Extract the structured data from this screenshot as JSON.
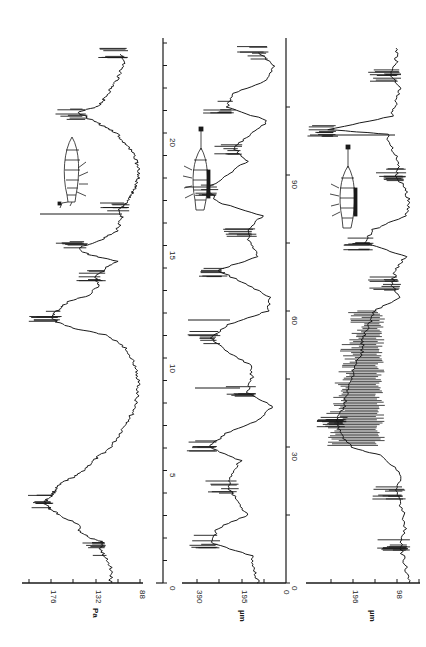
{
  "figure": {
    "orientation": "rotated-90-ccw",
    "ink_color": "#1a1a1a",
    "background": "#ffffff"
  },
  "chart_data": [
    {
      "type": "line",
      "panel": "top",
      "title": "",
      "xlabel": "",
      "ylabel": "Pa",
      "x_ticks": [
        0,
        5,
        10,
        15,
        20
      ],
      "y_ticks": [
        88,
        132,
        176
      ],
      "xlim": [
        0,
        24
      ],
      "ylim": [
        70,
        210
      ],
      "insect_icon": "insect-pressure-sensor",
      "x": [
        0,
        0.5,
        1,
        1.5,
        1.8,
        2,
        2.3,
        2.6,
        3,
        3.3,
        3.6,
        3.9,
        4.2,
        4.5,
        4.8,
        5.2,
        5.6,
        6,
        6.5,
        7,
        7.5,
        8,
        8.5,
        9,
        9.5,
        10,
        10.5,
        11,
        11.3,
        11.6,
        11.9,
        12.2,
        12.5,
        12.8,
        13.2,
        13.6,
        14,
        14.3,
        14.6,
        14.9,
        15.2,
        15.6,
        16,
        16.3,
        16.6,
        17,
        17.3,
        17.6,
        18,
        18.4,
        18.8,
        19.2,
        19.6,
        20,
        20.3,
        20.6,
        20.9,
        21.2,
        21.5,
        21.9,
        22.3,
        22.7,
        23.1,
        23.5
      ],
      "values": [
        118,
        116,
        120,
        128,
        124,
        138,
        148,
        150,
        168,
        178,
        184,
        176,
        172,
        164,
        150,
        140,
        130,
        118,
        110,
        104,
        96,
        92,
        90,
        90,
        92,
        96,
        104,
        120,
        152,
        172,
        176,
        168,
        160,
        138,
        130,
        132,
        122,
        110,
        140,
        150,
        130,
        112,
        108,
        106,
        108,
        100,
        96,
        92,
        90,
        90,
        92,
        96,
        104,
        112,
        124,
        138,
        150,
        130,
        124,
        118,
        112,
        108,
        104,
        108
      ],
      "annotations": [
        "dense oscillation bursts near x≈3-4.5, 11.5-12.8, 14.8, 20.8",
        "single vertical artifact spike at x≈16.3"
      ]
    },
    {
      "type": "line",
      "panel": "middle",
      "title": "",
      "xlabel": "",
      "ylabel": "µm",
      "x_ticks": [
        0,
        30,
        60,
        90
      ],
      "y_ticks": [
        0,
        195,
        390
      ],
      "xlim": [
        0,
        120
      ],
      "ylim": [
        0,
        450
      ],
      "insect_icon": "insect-displacement-sensor",
      "x": [
        0,
        3,
        6,
        9,
        12,
        15,
        18,
        21,
        24,
        27,
        30,
        33,
        36,
        39,
        42,
        45,
        48,
        51,
        54,
        57,
        60,
        63,
        66,
        69,
        72,
        75,
        78,
        81,
        84,
        87,
        90,
        93,
        96,
        99,
        102,
        105,
        108,
        111,
        114,
        117
      ],
      "values": [
        120,
        140,
        150,
        330,
        300,
        170,
        210,
        250,
        240,
        200,
        340,
        260,
        120,
        60,
        170,
        150,
        150,
        260,
        330,
        250,
        80,
        70,
        180,
        300,
        120,
        160,
        170,
        100,
        300,
        340,
        260,
        170,
        230,
        150,
        80,
        260,
        230,
        80,
        50,
        120
      ],
      "annotations": [
        "bursts near x≈8-14, 30-36, 51-55, 80-85, 98-103, 110-114",
        "tall artifact spikes near x≈43, 62"
      ]
    },
    {
      "type": "line",
      "panel": "bottom",
      "title": "",
      "xlabel": "",
      "ylabel": "µm",
      "x_ticks": [],
      "y_ticks": [
        98,
        196
      ],
      "xlim": [
        0,
        120
      ],
      "ylim": [
        40,
        260
      ],
      "insect_icon": "insect-displacement-sensor",
      "x": [
        0,
        4,
        8,
        12,
        16,
        20,
        24,
        28,
        30,
        33,
        36,
        39,
        42,
        45,
        48,
        51,
        54,
        57,
        60,
        63,
        66,
        69,
        72,
        75,
        78,
        81,
        84,
        87,
        90,
        93,
        96,
        99,
        100,
        103,
        106,
        109,
        112,
        115,
        118
      ],
      "values": [
        70,
        80,
        90,
        80,
        85,
        100,
        90,
        130,
        200,
        225,
        230,
        215,
        210,
        200,
        190,
        175,
        175,
        160,
        150,
        90,
        110,
        100,
        80,
        170,
        150,
        80,
        70,
        80,
        100,
        95,
        110,
        120,
        250,
        110,
        100,
        90,
        110,
        100,
        100
      ],
      "annotations": [
        "dense oscillation region x≈30-60",
        "burst near x≈75",
        "single spike at x≈100"
      ]
    }
  ],
  "panels": {
    "top": {
      "y_label": "Pa",
      "y_tick_labels": [
        "176",
        "132",
        "88"
      ],
      "x_tick_labels": [
        "0",
        "5",
        "10",
        "15",
        "20"
      ]
    },
    "middle": {
      "y_label": "µm",
      "y_tick_labels": [
        "390",
        "195",
        "0"
      ],
      "x_tick_labels": [
        "0",
        "30",
        "60",
        "90"
      ]
    },
    "bottom": {
      "y_label": "µm",
      "y_tick_labels": [
        "196",
        "98"
      ]
    }
  }
}
